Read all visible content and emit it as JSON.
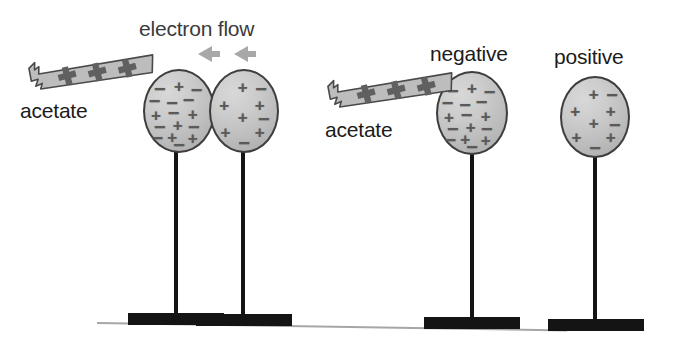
{
  "diagram": {
    "background_color": "#ffffff",
    "sphere_fill_color": "#c4c4c4",
    "sphere_stroke_color": "#3d3d3d",
    "charge_symbol_color": "#5a5a5a",
    "stand_color": "#141414",
    "table_line_color": "#a6a6a6",
    "acetate_fill_color": "#bdbdbd",
    "acetate_stroke_color": "#4a4a4a",
    "arrow_color": "#a0a0a0"
  },
  "labels": {
    "electron_flow": "electron flow",
    "acetate_left": "acetate",
    "acetate_right": "acetate",
    "negative": "negative",
    "positive": "positive"
  },
  "acetate_strips": [
    {
      "id": "acetate-strip-left",
      "charges": [
        "+",
        "+",
        "+"
      ],
      "rotation_deg": -15
    },
    {
      "id": "acetate-strip-right",
      "charges": [
        "+",
        "+",
        "+"
      ],
      "rotation_deg": -15
    }
  ],
  "arrows": {
    "name": "electron-flow-arrows",
    "direction": "left",
    "count": 2
  },
  "spheres": [
    {
      "id": "sphere-1",
      "label": "",
      "net_charge": "mixed-negative",
      "symbols": [
        {
          "s": "−",
          "x": 22,
          "y": 22
        },
        {
          "s": "+",
          "x": 50,
          "y": 19
        },
        {
          "s": "−",
          "x": 76,
          "y": 24
        },
        {
          "s": "−",
          "x": 14,
          "y": 38
        },
        {
          "s": "−",
          "x": 40,
          "y": 40
        },
        {
          "s": "−",
          "x": 64,
          "y": 36
        },
        {
          "s": "+",
          "x": 16,
          "y": 55
        },
        {
          "s": "−",
          "x": 42,
          "y": 53
        },
        {
          "s": "+",
          "x": 70,
          "y": 54
        },
        {
          "s": "−",
          "x": 22,
          "y": 70
        },
        {
          "s": "+",
          "x": 48,
          "y": 68
        },
        {
          "s": "−",
          "x": 72,
          "y": 70
        },
        {
          "s": "−",
          "x": 18,
          "y": 84
        },
        {
          "s": "+",
          "x": 40,
          "y": 83
        },
        {
          "s": "+",
          "x": 70,
          "y": 84
        },
        {
          "s": "−",
          "x": 50,
          "y": 92
        }
      ]
    },
    {
      "id": "sphere-2",
      "label": "",
      "net_charge": "positive",
      "symbols": [
        {
          "s": "+",
          "x": 48,
          "y": 20
        },
        {
          "s": "−",
          "x": 76,
          "y": 22
        },
        {
          "s": "+",
          "x": 20,
          "y": 42
        },
        {
          "s": "+",
          "x": 74,
          "y": 42
        },
        {
          "s": "+",
          "x": 48,
          "y": 58
        },
        {
          "s": "−",
          "x": 80,
          "y": 60
        },
        {
          "s": "+",
          "x": 22,
          "y": 76
        },
        {
          "s": "+",
          "x": 74,
          "y": 76
        },
        {
          "s": "−",
          "x": 50,
          "y": 90
        }
      ]
    },
    {
      "id": "sphere-3",
      "label": "negative",
      "net_charge": "mixed-negative",
      "symbols": [
        {
          "s": "−",
          "x": 22,
          "y": 22
        },
        {
          "s": "+",
          "x": 50,
          "y": 19
        },
        {
          "s": "−",
          "x": 76,
          "y": 24
        },
        {
          "s": "−",
          "x": 14,
          "y": 38
        },
        {
          "s": "−",
          "x": 40,
          "y": 40
        },
        {
          "s": "−",
          "x": 64,
          "y": 36
        },
        {
          "s": "+",
          "x": 16,
          "y": 55
        },
        {
          "s": "−",
          "x": 42,
          "y": 53
        },
        {
          "s": "+",
          "x": 70,
          "y": 54
        },
        {
          "s": "−",
          "x": 22,
          "y": 70
        },
        {
          "s": "+",
          "x": 48,
          "y": 68
        },
        {
          "s": "−",
          "x": 72,
          "y": 70
        },
        {
          "s": "−",
          "x": 18,
          "y": 84
        },
        {
          "s": "+",
          "x": 40,
          "y": 83
        },
        {
          "s": "+",
          "x": 70,
          "y": 84
        },
        {
          "s": "−",
          "x": 50,
          "y": 92
        }
      ]
    },
    {
      "id": "sphere-4",
      "label": "positive",
      "net_charge": "positive",
      "symbols": [
        {
          "s": "+",
          "x": 48,
          "y": 20
        },
        {
          "s": "−",
          "x": 76,
          "y": 22
        },
        {
          "s": "+",
          "x": 20,
          "y": 42
        },
        {
          "s": "+",
          "x": 74,
          "y": 42
        },
        {
          "s": "+",
          "x": 48,
          "y": 58
        },
        {
          "s": "−",
          "x": 80,
          "y": 60
        },
        {
          "s": "+",
          "x": 22,
          "y": 76
        },
        {
          "s": "+",
          "x": 74,
          "y": 76
        },
        {
          "s": "−",
          "x": 50,
          "y": 90
        }
      ]
    }
  ],
  "stands": [
    {
      "id": "stand-1"
    },
    {
      "id": "stand-2"
    },
    {
      "id": "stand-3"
    },
    {
      "id": "stand-4"
    }
  ]
}
